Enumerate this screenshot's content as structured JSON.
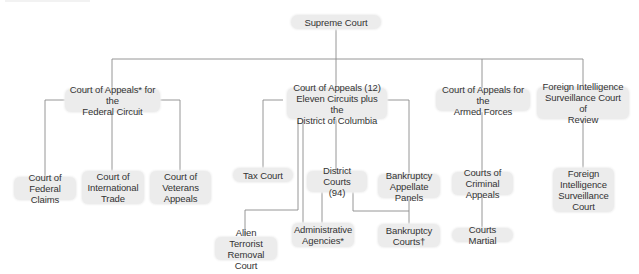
{
  "diagram": {
    "title": "",
    "type": "organization-tree",
    "line_color": "#8a8a8a",
    "node_fill": "#ececec",
    "text_color": "#333333",
    "nodes": {
      "supreme": {
        "label": "Supreme Court"
      },
      "fed_circuit": {
        "label": "Court of Appeals* for the\nFederal Circuit"
      },
      "appeals12": {
        "label": "Court of Appeals (12)\nEleven Circuits plus the\nDistrict of Columbia"
      },
      "armed_forces": {
        "label": "Court of Appeals for the\nArmed Forces"
      },
      "fisc_review": {
        "label": "Foreign Intelligence\nSurveillance Court of\nReview"
      },
      "federal_claims": {
        "label": "Court of\nFederal Claims"
      },
      "intl_trade": {
        "label": "Court of\nInternational\nTrade"
      },
      "veterans": {
        "label": "Court of\nVeterans\nAppeals"
      },
      "tax": {
        "label": "Tax Court"
      },
      "district": {
        "label": "District Courts\n(94)"
      },
      "bankruptcy_panels": {
        "label": "Bankruptcy\nAppellate Panels"
      },
      "criminal_appeals": {
        "label": "Courts of\nCriminal Appeals"
      },
      "fisc": {
        "label": "Foreign\nIntelligence\nSurveillance\nCourt"
      },
      "alien_terrorist": {
        "label": "Alien Terrorist\nRemoval Court"
      },
      "admin_agencies": {
        "label": "Administrative\nAgencies*"
      },
      "bankruptcy_courts": {
        "label": "Bankruptcy\nCourts†"
      },
      "courts_martial": {
        "label": "Courts Martial"
      }
    },
    "edges": [
      [
        "supreme",
        "fed_circuit"
      ],
      [
        "supreme",
        "appeals12"
      ],
      [
        "supreme",
        "armed_forces"
      ],
      [
        "supreme",
        "fisc_review"
      ],
      [
        "fed_circuit",
        "federal_claims"
      ],
      [
        "fed_circuit",
        "intl_trade"
      ],
      [
        "fed_circuit",
        "veterans"
      ],
      [
        "appeals12",
        "tax"
      ],
      [
        "appeals12",
        "district"
      ],
      [
        "appeals12",
        "bankruptcy_panels"
      ],
      [
        "appeals12",
        "alien_terrorist"
      ],
      [
        "appeals12",
        "admin_agencies"
      ],
      [
        "district",
        "admin_agencies"
      ],
      [
        "district",
        "bankruptcy_courts"
      ],
      [
        "bankruptcy_panels",
        "bankruptcy_courts"
      ],
      [
        "armed_forces",
        "criminal_appeals"
      ],
      [
        "criminal_appeals",
        "courts_martial"
      ],
      [
        "fisc_review",
        "fisc"
      ]
    ]
  }
}
